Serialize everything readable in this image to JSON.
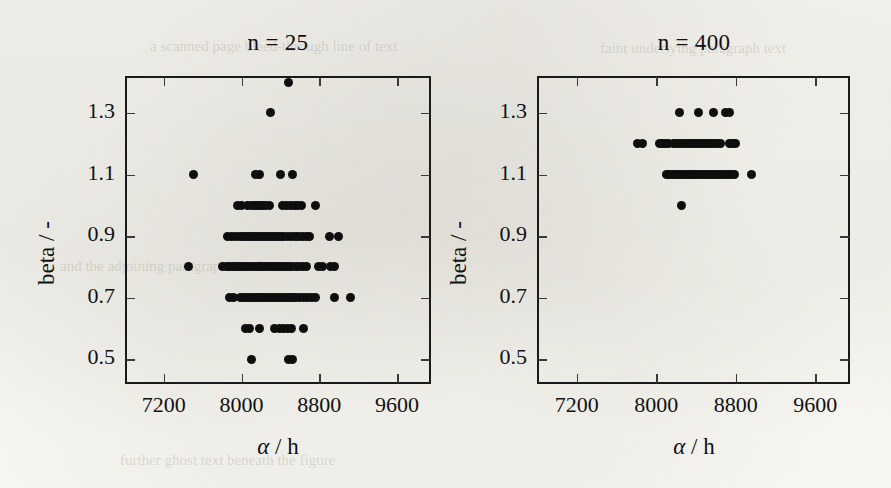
{
  "figure": {
    "background_color": "#f7f6f2",
    "marker_color": "#0d0d0d",
    "axis_color": "#1a1a1a",
    "ghost_text": [
      {
        "text": "a scanned page bleed-through line of text",
        "x": 150,
        "y": 38,
        "size": 15
      },
      {
        "text": "faint underlying paragraph text",
        "x": 600,
        "y": 40,
        "size": 15
      },
      {
        "text": "and the adjoining paragraph line here",
        "x": 60,
        "y": 258,
        "size": 15
      },
      {
        "text": "further ghost text beneath the figure",
        "x": 120,
        "y": 452,
        "size": 15
      }
    ]
  },
  "panels": [
    {
      "id": "left",
      "title": "n = 25",
      "xlabel_alpha": "α",
      "xlabel_rest": " / h",
      "ylabel": "beta / -"
    },
    {
      "id": "right",
      "title": "n = 400",
      "xlabel_alpha": "α",
      "xlabel_rest": " / h",
      "ylabel": "beta / -"
    }
  ],
  "chart_data": [
    {
      "type": "scatter",
      "title": "n = 25",
      "xlabel": "α / h",
      "ylabel": "beta / -",
      "xlim": [
        6800,
        9950
      ],
      "ylim": [
        0.42,
        1.42
      ],
      "xticks": [
        7200,
        8000,
        8800,
        9600
      ],
      "yticks": [
        0.5,
        0.7,
        0.9,
        1.1,
        1.3
      ],
      "xticklabels": [
        "7200",
        "8000",
        "8800",
        "9600"
      ],
      "yticklabels": [
        "0.5",
        "0.7",
        "0.9",
        "1.1",
        "1.3"
      ],
      "grid": false,
      "legend": "none",
      "marker": "filled-circle",
      "points": [
        {
          "x": 8480,
          "y": 1.4
        },
        {
          "x": 8300,
          "y": 1.3
        },
        {
          "x": 7500,
          "y": 1.1
        },
        {
          "x": 8140,
          "y": 1.1
        },
        {
          "x": 8180,
          "y": 1.1
        },
        {
          "x": 8400,
          "y": 1.1
        },
        {
          "x": 8520,
          "y": 1.1
        },
        {
          "x": 7960,
          "y": 1.0
        },
        {
          "x": 8000,
          "y": 1.0
        },
        {
          "x": 8060,
          "y": 1.0
        },
        {
          "x": 8100,
          "y": 1.0
        },
        {
          "x": 8130,
          "y": 1.0
        },
        {
          "x": 8160,
          "y": 1.0
        },
        {
          "x": 8190,
          "y": 1.0
        },
        {
          "x": 8220,
          "y": 1.0
        },
        {
          "x": 8250,
          "y": 1.0
        },
        {
          "x": 8290,
          "y": 1.0
        },
        {
          "x": 8420,
          "y": 1.0
        },
        {
          "x": 8460,
          "y": 1.0
        },
        {
          "x": 8500,
          "y": 1.0
        },
        {
          "x": 8540,
          "y": 1.0
        },
        {
          "x": 8580,
          "y": 1.0
        },
        {
          "x": 8620,
          "y": 1.0
        },
        {
          "x": 8760,
          "y": 1.0
        },
        {
          "x": 7860,
          "y": 0.9
        },
        {
          "x": 7900,
          "y": 0.9
        },
        {
          "x": 7940,
          "y": 0.9
        },
        {
          "x": 7980,
          "y": 0.9
        },
        {
          "x": 8010,
          "y": 0.9
        },
        {
          "x": 8040,
          "y": 0.9
        },
        {
          "x": 8070,
          "y": 0.9
        },
        {
          "x": 8100,
          "y": 0.9
        },
        {
          "x": 8130,
          "y": 0.9
        },
        {
          "x": 8160,
          "y": 0.9
        },
        {
          "x": 8190,
          "y": 0.9
        },
        {
          "x": 8220,
          "y": 0.9
        },
        {
          "x": 8250,
          "y": 0.9
        },
        {
          "x": 8280,
          "y": 0.9
        },
        {
          "x": 8310,
          "y": 0.9
        },
        {
          "x": 8340,
          "y": 0.9
        },
        {
          "x": 8370,
          "y": 0.9
        },
        {
          "x": 8400,
          "y": 0.9
        },
        {
          "x": 8430,
          "y": 0.9
        },
        {
          "x": 8470,
          "y": 0.9
        },
        {
          "x": 8510,
          "y": 0.9
        },
        {
          "x": 8550,
          "y": 0.9
        },
        {
          "x": 8590,
          "y": 0.9
        },
        {
          "x": 8630,
          "y": 0.9
        },
        {
          "x": 8670,
          "y": 0.9
        },
        {
          "x": 8700,
          "y": 0.9
        },
        {
          "x": 8900,
          "y": 0.9
        },
        {
          "x": 9000,
          "y": 0.9
        },
        {
          "x": 7450,
          "y": 0.8
        },
        {
          "x": 7800,
          "y": 0.8
        },
        {
          "x": 7840,
          "y": 0.8
        },
        {
          "x": 7880,
          "y": 0.8
        },
        {
          "x": 7910,
          "y": 0.8
        },
        {
          "x": 7940,
          "y": 0.8
        },
        {
          "x": 7970,
          "y": 0.8
        },
        {
          "x": 8000,
          "y": 0.8
        },
        {
          "x": 8030,
          "y": 0.8
        },
        {
          "x": 8060,
          "y": 0.8
        },
        {
          "x": 8090,
          "y": 0.8
        },
        {
          "x": 8120,
          "y": 0.8
        },
        {
          "x": 8150,
          "y": 0.8
        },
        {
          "x": 8180,
          "y": 0.8
        },
        {
          "x": 8210,
          "y": 0.8
        },
        {
          "x": 8240,
          "y": 0.8
        },
        {
          "x": 8270,
          "y": 0.8
        },
        {
          "x": 8300,
          "y": 0.8
        },
        {
          "x": 8330,
          "y": 0.8
        },
        {
          "x": 8360,
          "y": 0.8
        },
        {
          "x": 8390,
          "y": 0.8
        },
        {
          "x": 8420,
          "y": 0.8
        },
        {
          "x": 8450,
          "y": 0.8
        },
        {
          "x": 8480,
          "y": 0.8
        },
        {
          "x": 8510,
          "y": 0.8
        },
        {
          "x": 8550,
          "y": 0.8
        },
        {
          "x": 8590,
          "y": 0.8
        },
        {
          "x": 8630,
          "y": 0.8
        },
        {
          "x": 8670,
          "y": 0.8
        },
        {
          "x": 8790,
          "y": 0.8
        },
        {
          "x": 8830,
          "y": 0.8
        },
        {
          "x": 8920,
          "y": 0.8
        },
        {
          "x": 8960,
          "y": 0.8
        },
        {
          "x": 7880,
          "y": 0.7
        },
        {
          "x": 7920,
          "y": 0.7
        },
        {
          "x": 7990,
          "y": 0.7
        },
        {
          "x": 8020,
          "y": 0.7
        },
        {
          "x": 8050,
          "y": 0.7
        },
        {
          "x": 8080,
          "y": 0.7
        },
        {
          "x": 8110,
          "y": 0.7
        },
        {
          "x": 8140,
          "y": 0.7
        },
        {
          "x": 8170,
          "y": 0.7
        },
        {
          "x": 8200,
          "y": 0.7
        },
        {
          "x": 8230,
          "y": 0.7
        },
        {
          "x": 8260,
          "y": 0.7
        },
        {
          "x": 8290,
          "y": 0.7
        },
        {
          "x": 8320,
          "y": 0.7
        },
        {
          "x": 8350,
          "y": 0.7
        },
        {
          "x": 8380,
          "y": 0.7
        },
        {
          "x": 8410,
          "y": 0.7
        },
        {
          "x": 8440,
          "y": 0.7
        },
        {
          "x": 8470,
          "y": 0.7
        },
        {
          "x": 8500,
          "y": 0.7
        },
        {
          "x": 8530,
          "y": 0.7
        },
        {
          "x": 8560,
          "y": 0.7
        },
        {
          "x": 8600,
          "y": 0.7
        },
        {
          "x": 8640,
          "y": 0.7
        },
        {
          "x": 8680,
          "y": 0.7
        },
        {
          "x": 8720,
          "y": 0.7
        },
        {
          "x": 8760,
          "y": 0.7
        },
        {
          "x": 8960,
          "y": 0.7
        },
        {
          "x": 9120,
          "y": 0.7
        },
        {
          "x": 8040,
          "y": 0.6
        },
        {
          "x": 8080,
          "y": 0.6
        },
        {
          "x": 8180,
          "y": 0.6
        },
        {
          "x": 8340,
          "y": 0.6
        },
        {
          "x": 8390,
          "y": 0.6
        },
        {
          "x": 8430,
          "y": 0.6
        },
        {
          "x": 8470,
          "y": 0.6
        },
        {
          "x": 8510,
          "y": 0.6
        },
        {
          "x": 8640,
          "y": 0.6
        },
        {
          "x": 8100,
          "y": 0.5
        },
        {
          "x": 8480,
          "y": 0.5
        },
        {
          "x": 8520,
          "y": 0.5
        }
      ]
    },
    {
      "type": "scatter",
      "title": "n = 400",
      "xlabel": "α / h",
      "ylabel": "beta / -",
      "xlim": [
        6800,
        9950
      ],
      "ylim": [
        0.42,
        1.42
      ],
      "xticks": [
        7200,
        8000,
        8800,
        9600
      ],
      "yticks": [
        0.5,
        0.7,
        0.9,
        1.1,
        1.3
      ],
      "xticklabels": [
        "7200",
        "8000",
        "8800",
        "9600"
      ],
      "yticklabels": [
        "0.5",
        "0.7",
        "0.9",
        "1.1",
        "1.3"
      ],
      "grid": false,
      "legend": "none",
      "marker": "filled-circle",
      "points": [
        {
          "x": 8230,
          "y": 1.3
        },
        {
          "x": 8430,
          "y": 1.3
        },
        {
          "x": 8580,
          "y": 1.3
        },
        {
          "x": 8700,
          "y": 1.3
        },
        {
          "x": 8740,
          "y": 1.3
        },
        {
          "x": 7810,
          "y": 1.2
        },
        {
          "x": 7860,
          "y": 1.2
        },
        {
          "x": 8030,
          "y": 1.2
        },
        {
          "x": 8060,
          "y": 1.2
        },
        {
          "x": 8090,
          "y": 1.2
        },
        {
          "x": 8120,
          "y": 1.2
        },
        {
          "x": 8170,
          "y": 1.2
        },
        {
          "x": 8200,
          "y": 1.2
        },
        {
          "x": 8230,
          "y": 1.2
        },
        {
          "x": 8260,
          "y": 1.2
        },
        {
          "x": 8290,
          "y": 1.2
        },
        {
          "x": 8320,
          "y": 1.2
        },
        {
          "x": 8350,
          "y": 1.2
        },
        {
          "x": 8380,
          "y": 1.2
        },
        {
          "x": 8410,
          "y": 1.2
        },
        {
          "x": 8440,
          "y": 1.2
        },
        {
          "x": 8470,
          "y": 1.2
        },
        {
          "x": 8500,
          "y": 1.2
        },
        {
          "x": 8530,
          "y": 1.2
        },
        {
          "x": 8560,
          "y": 1.2
        },
        {
          "x": 8590,
          "y": 1.2
        },
        {
          "x": 8620,
          "y": 1.2
        },
        {
          "x": 8650,
          "y": 1.2
        },
        {
          "x": 8740,
          "y": 1.2
        },
        {
          "x": 8770,
          "y": 1.2
        },
        {
          "x": 8800,
          "y": 1.2
        },
        {
          "x": 8100,
          "y": 1.1
        },
        {
          "x": 8130,
          "y": 1.1
        },
        {
          "x": 8160,
          "y": 1.1
        },
        {
          "x": 8190,
          "y": 1.1
        },
        {
          "x": 8220,
          "y": 1.1
        },
        {
          "x": 8250,
          "y": 1.1
        },
        {
          "x": 8280,
          "y": 1.1
        },
        {
          "x": 8310,
          "y": 1.1
        },
        {
          "x": 8340,
          "y": 1.1
        },
        {
          "x": 8370,
          "y": 1.1
        },
        {
          "x": 8400,
          "y": 1.1
        },
        {
          "x": 8430,
          "y": 1.1
        },
        {
          "x": 8460,
          "y": 1.1
        },
        {
          "x": 8490,
          "y": 1.1
        },
        {
          "x": 8520,
          "y": 1.1
        },
        {
          "x": 8550,
          "y": 1.1
        },
        {
          "x": 8580,
          "y": 1.1
        },
        {
          "x": 8610,
          "y": 1.1
        },
        {
          "x": 8640,
          "y": 1.1
        },
        {
          "x": 8670,
          "y": 1.1
        },
        {
          "x": 8700,
          "y": 1.1
        },
        {
          "x": 8730,
          "y": 1.1
        },
        {
          "x": 8760,
          "y": 1.1
        },
        {
          "x": 8790,
          "y": 1.1
        },
        {
          "x": 8960,
          "y": 1.1
        },
        {
          "x": 8250,
          "y": 1.0
        }
      ]
    }
  ]
}
